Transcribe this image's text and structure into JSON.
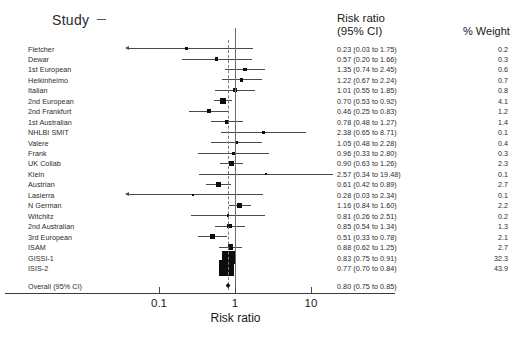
{
  "header": {
    "study_label": "Study",
    "risk_ratio_line1": "Risk ratio",
    "risk_ratio_line2": "(95% CI)",
    "weight_label": "% Weight"
  },
  "axis": {
    "title": "Risk ratio",
    "ticks": [
      "0.1",
      "1",
      "10"
    ],
    "tick_values": [
      0.1,
      1,
      10
    ],
    "scale": "log",
    "null_value": 1
  },
  "overall": {
    "label": "Overall (95% CI)",
    "text": "0.80 (0.75 to 0.85)",
    "estimate": 0.8,
    "lower": 0.75,
    "upper": 0.85
  },
  "chart_data": {
    "type": "forest",
    "title": "",
    "xlabel": "Risk ratio",
    "ylabel": "",
    "xscale": "log",
    "xlim": [
      0.1,
      10
    ],
    "grid": false,
    "null_line": 1,
    "pooled_line": 0.8,
    "columns": [
      "Study",
      "Risk ratio (95% CI)",
      "% Weight"
    ],
    "rows": [
      {
        "study": "Fletcher",
        "text": "0.23 (0.03 to 1.75)",
        "est": 0.23,
        "lo": 0.03,
        "hi": 1.75,
        "weight": "0.2",
        "w": 0.2,
        "clipped_left": true
      },
      {
        "study": "Dewar",
        "text": "0.57 (0.20 to 1.66)",
        "est": 0.57,
        "lo": 0.2,
        "hi": 1.66,
        "weight": "0.3",
        "w": 0.3,
        "clipped_left": false
      },
      {
        "study": "1st European",
        "text": "1.35 (0.74 to 2.45)",
        "est": 1.35,
        "lo": 0.74,
        "hi": 2.45,
        "weight": "0.6",
        "w": 0.6,
        "clipped_left": false
      },
      {
        "study": "Heikinheimo",
        "text": "1.22 (0.67 to 2.24)",
        "est": 1.22,
        "lo": 0.67,
        "hi": 2.24,
        "weight": "0.7",
        "w": 0.7,
        "clipped_left": false
      },
      {
        "study": "Italian",
        "text": "1.01 (0.55 to 1.85)",
        "est": 1.01,
        "lo": 0.55,
        "hi": 1.85,
        "weight": "0.8",
        "w": 0.8,
        "clipped_left": false
      },
      {
        "study": "2nd European",
        "text": "0.70 (0.53 to 0.92)",
        "est": 0.7,
        "lo": 0.53,
        "hi": 0.92,
        "weight": "4.1",
        "w": 4.1,
        "clipped_left": false
      },
      {
        "study": "2nd Frankfurt",
        "text": "0.46 (0.25 to 0.83)",
        "est": 0.46,
        "lo": 0.25,
        "hi": 0.83,
        "weight": "1.2",
        "w": 1.2,
        "clipped_left": false
      },
      {
        "study": "1st Australian",
        "text": "0.78 (0.48 to 1.27)",
        "est": 0.78,
        "lo": 0.48,
        "hi": 1.27,
        "weight": "1.4",
        "w": 1.4,
        "clipped_left": false
      },
      {
        "study": "NHLBI SMIT",
        "text": "2.38 (0.65 to 8.71)",
        "est": 2.38,
        "lo": 0.65,
        "hi": 8.71,
        "weight": "0.1",
        "w": 0.1,
        "clipped_left": false
      },
      {
        "study": "Valere",
        "text": "1.05 (0.48 to 2.28)",
        "est": 1.05,
        "lo": 0.48,
        "hi": 2.28,
        "weight": "0.4",
        "w": 0.4,
        "clipped_left": false
      },
      {
        "study": "Frank",
        "text": "0.96 (0.33 to 2.80)",
        "est": 0.96,
        "lo": 0.33,
        "hi": 2.8,
        "weight": "0.3",
        "w": 0.3,
        "clipped_left": false
      },
      {
        "study": "UK Collab",
        "text": "0.90 (0.63 to 1.26)",
        "est": 0.9,
        "lo": 0.63,
        "hi": 1.26,
        "weight": "2.3",
        "w": 2.3,
        "clipped_left": false
      },
      {
        "study": "Klein",
        "text": "2.57 (0.34 to 19.48)",
        "est": 2.57,
        "lo": 0.34,
        "hi": 19.48,
        "weight": "0.1",
        "w": 0.1,
        "clipped_left": false
      },
      {
        "study": "Austrian",
        "text": "0.61 (0.42 to 0.89)",
        "est": 0.61,
        "lo": 0.42,
        "hi": 0.89,
        "weight": "2.7",
        "w": 2.7,
        "clipped_left": false
      },
      {
        "study": "Lasierra",
        "text": "0.28 (0.03 to 2.34)",
        "est": 0.28,
        "lo": 0.03,
        "hi": 2.34,
        "weight": "0.1",
        "w": 0.1,
        "clipped_left": false
      },
      {
        "study": "N German",
        "text": "1.16 (0.84 to 1.60)",
        "est": 1.16,
        "lo": 0.84,
        "hi": 1.6,
        "weight": "2.2",
        "w": 2.2,
        "clipped_left": false
      },
      {
        "study": "Witchitz",
        "text": "0.81 (0.26 to 2.51)",
        "est": 0.81,
        "lo": 0.26,
        "hi": 2.51,
        "weight": "0.2",
        "w": 0.2,
        "clipped_left": false
      },
      {
        "study": "2nd Australian",
        "text": "0.85 (0.54 to 1.34)",
        "est": 0.85,
        "lo": 0.54,
        "hi": 1.34,
        "weight": "1.3",
        "w": 1.3,
        "clipped_left": false
      },
      {
        "study": "3rd European",
        "text": "0.51 (0.33 to 0.78)",
        "est": 0.51,
        "lo": 0.33,
        "hi": 0.78,
        "weight": "2.1",
        "w": 2.1,
        "clipped_left": false
      },
      {
        "study": "ISAM",
        "text": "0.88 (0.62 to 1.25)",
        "est": 0.88,
        "lo": 0.62,
        "hi": 1.25,
        "weight": "2.7",
        "w": 2.7,
        "clipped_left": false
      },
      {
        "study": "GISSI-1",
        "text": "0.83 (0.75 to 0.91)",
        "est": 0.83,
        "lo": 0.75,
        "hi": 0.91,
        "weight": "32.3",
        "w": 32.3,
        "clipped_left": false
      },
      {
        "study": "ISIS-2",
        "text": "0.77 (0.70 to 0.84)",
        "est": 0.77,
        "lo": 0.7,
        "hi": 0.84,
        "weight": "43.9",
        "w": 43.9,
        "clipped_left": false
      }
    ]
  }
}
